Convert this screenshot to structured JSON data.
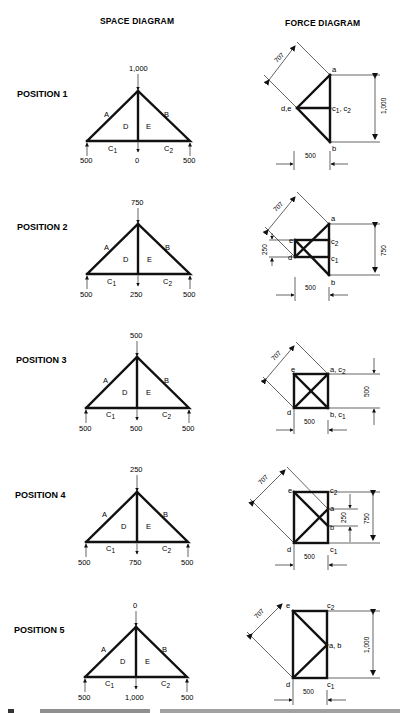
{
  "headers": {
    "space": "SPACE DIAGRAM",
    "force": "FORCE DIAGRAM"
  },
  "positions": [
    {
      "label": "POSITION 1",
      "space": {
        "top_load": "1,000",
        "left_reaction": "500",
        "mid_load": "0",
        "right_reaction": "500",
        "regions": [
          "A",
          "B",
          "D",
          "E"
        ],
        "base_left": "C",
        "base_left_sub": "1",
        "base_right": "C",
        "base_right_sub": "2"
      },
      "force": {
        "diag": "707",
        "height": "1,000",
        "width": "500",
        "points": {
          "a": "a",
          "b": "b",
          "de": "d,e",
          "c": "c",
          "c_sub1": "1",
          "c_sep": ",",
          "c_b": "c",
          "c_sub2": "2"
        }
      }
    },
    {
      "label": "POSITION 2",
      "space": {
        "top_load": "750",
        "left_reaction": "500",
        "mid_load": "250",
        "right_reaction": "500",
        "regions": [
          "A",
          "B",
          "D",
          "E"
        ],
        "base_left": "C",
        "base_left_sub": "1",
        "base_right": "C",
        "base_right_sub": "2"
      },
      "force": {
        "diag": "707",
        "height": "750",
        "inner": "250",
        "width": "500",
        "points": {
          "a": "a",
          "b": "b",
          "e": "e",
          "d": "d",
          "c2": "c",
          "c2_sub": "2",
          "c1": "c",
          "c1_sub": "1"
        }
      }
    },
    {
      "label": "POSITION 3",
      "space": {
        "top_load": "500",
        "left_reaction": "500",
        "mid_load": "500",
        "right_reaction": "500",
        "regions": [
          "A",
          "B",
          "D",
          "E"
        ],
        "base_left": "C",
        "base_left_sub": "1",
        "base_right": "C",
        "base_right_sub": "2"
      },
      "force": {
        "diag": "707",
        "height": "500",
        "width": "500",
        "points": {
          "e": "e",
          "d": "d",
          "ac2": "a, c",
          "ac2_sub": "2",
          "bc1": "b, c",
          "bc1_sub": "1"
        }
      }
    },
    {
      "label": "POSITION 4",
      "space": {
        "top_load": "250",
        "left_reaction": "500",
        "mid_load": "750",
        "right_reaction": "500",
        "regions": [
          "A",
          "B",
          "D",
          "E"
        ],
        "base_left": "C",
        "base_left_sub": "1",
        "base_right": "C",
        "base_right_sub": "2"
      },
      "force": {
        "diag": "707",
        "height": "750",
        "inner": "250",
        "width": "500",
        "points": {
          "e": "e",
          "d": "d",
          "a": "a",
          "b": "b",
          "c2": "c",
          "c2_sub": "2",
          "c1": "c",
          "c1_sub": "1"
        }
      }
    },
    {
      "label": "POSITION 5",
      "space": {
        "top_load": "0",
        "left_reaction": "500",
        "mid_load": "1,000",
        "right_reaction": "500",
        "regions": [
          "A",
          "B",
          "D",
          "E"
        ],
        "base_left": "C",
        "base_left_sub": "1",
        "base_right": "C",
        "base_right_sub": "2"
      },
      "force": {
        "diag": "707",
        "height": "1,000",
        "width": "500",
        "points": {
          "e": "e",
          "d": "d",
          "ab": "a, b",
          "c2": "c",
          "c2_sub": "2",
          "c1": "c",
          "c1_sub": "1"
        }
      }
    }
  ]
}
